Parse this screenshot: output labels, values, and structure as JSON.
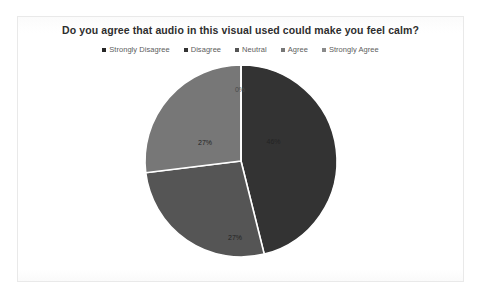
{
  "card": {
    "title": "Do you agree that audio in this visual used could make you feel calm?"
  },
  "legend": {
    "position": "top-center",
    "items": [
      {
        "label": "Strongly Disagree",
        "color": "#262626"
      },
      {
        "label": "Disagree",
        "color": "#333333"
      },
      {
        "label": "Neutral",
        "color": "#555555"
      },
      {
        "label": "Agree",
        "color": "#777777"
      },
      {
        "label": "Strongly Agree",
        "color": "#8a8a8a"
      }
    ]
  },
  "chart_data": {
    "type": "pie",
    "title": "Do you agree that audio in this visual used could make you feel calm?",
    "categories": [
      "Strongly Disagree",
      "Disagree",
      "Neutral",
      "Agree",
      "Strongly Agree"
    ],
    "values": [
      0,
      46,
      27,
      27,
      0
    ],
    "data_labels": [
      "0%",
      "46%",
      "27%",
      "27%",
      ""
    ],
    "colors": [
      "#262626",
      "#333333",
      "#555555",
      "#777777",
      "#8a8a8a"
    ],
    "slices": [
      {
        "name": "Strongly Disagree",
        "label": "0%",
        "value": 0,
        "color": "#262626",
        "start_angle": 0,
        "end_angle": 0,
        "label_x": 239,
        "label_y": 28,
        "label_class": "outside"
      },
      {
        "name": "Disagree",
        "label": "46%",
        "value": 46,
        "color": "#333333",
        "start_angle": 0,
        "end_angle": 166,
        "label_x": 306,
        "label_y": 80,
        "label_class": "on-dark"
      },
      {
        "name": "Neutral",
        "label": "27%",
        "value": 27,
        "color": "#555555",
        "start_angle": 166,
        "end_angle": 263,
        "label_x": 229,
        "label_y": 176,
        "label_class": "on-dark"
      },
      {
        "name": "Agree",
        "label": "27%",
        "value": 27,
        "color": "#777777",
        "start_angle": 263,
        "end_angle": 360,
        "label_x": 169,
        "label_y": 81,
        "label_class": "on-dark"
      }
    ],
    "grid": false,
    "legend_position": "top-center",
    "xlabel": "",
    "ylabel": ""
  }
}
